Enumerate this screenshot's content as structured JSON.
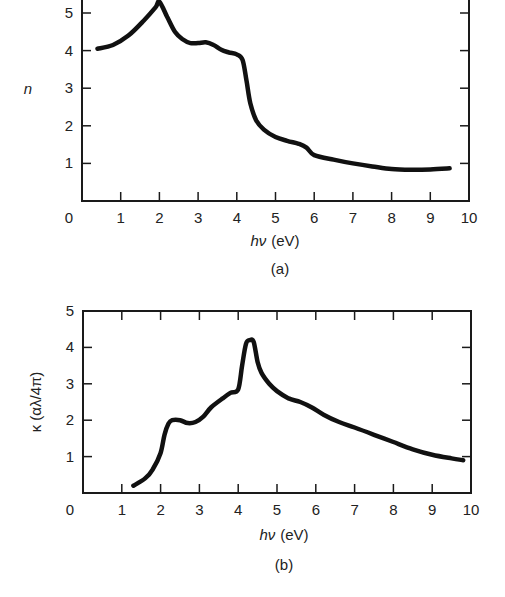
{
  "chart_data": [
    {
      "id": "a",
      "type": "line",
      "title": "",
      "caption": "(a)",
      "xlabel": "hν (eV)",
      "ylabel": "n",
      "xlim": [
        0,
        10
      ],
      "ylim": [
        0,
        5
      ],
      "x_ticks": [
        "0",
        "1",
        "2",
        "3",
        "4",
        "5",
        "6",
        "7",
        "8",
        "9",
        "10"
      ],
      "y_ticks": [
        "1",
        "2",
        "3",
        "4",
        "5"
      ],
      "grid": false,
      "legend": null,
      "series": [
        {
          "name": "n",
          "x": [
            0.4,
            0.8,
            1.2,
            1.6,
            1.9,
            2.0,
            2.2,
            2.4,
            2.6,
            2.8,
            3.0,
            3.2,
            3.4,
            3.6,
            3.8,
            4.0,
            4.15,
            4.25,
            4.35,
            4.5,
            4.7,
            5.0,
            5.3,
            5.6,
            5.8,
            6.0,
            6.5,
            7.0,
            7.5,
            8.0,
            8.5,
            9.0,
            9.5
          ],
          "y": [
            4.05,
            4.15,
            4.4,
            4.8,
            5.15,
            5.3,
            4.9,
            4.5,
            4.3,
            4.2,
            4.2,
            4.22,
            4.15,
            4.02,
            3.95,
            3.9,
            3.75,
            3.2,
            2.6,
            2.15,
            1.9,
            1.7,
            1.6,
            1.52,
            1.42,
            1.22,
            1.1,
            1.0,
            0.92,
            0.85,
            0.83,
            0.84,
            0.87
          ]
        }
      ]
    },
    {
      "id": "b",
      "type": "line",
      "title": "",
      "caption": "(b)",
      "xlabel": "hν (eV)",
      "ylabel": "κ (αλ/4π)",
      "xlim": [
        0,
        10
      ],
      "ylim": [
        0,
        5
      ],
      "x_ticks": [
        "0",
        "1",
        "2",
        "3",
        "4",
        "5",
        "6",
        "7",
        "8",
        "9",
        "10"
      ],
      "y_ticks": [
        "1",
        "2",
        "3",
        "4",
        "5"
      ],
      "grid": false,
      "legend": null,
      "series": [
        {
          "name": "κ",
          "x": [
            1.3,
            1.6,
            1.8,
            2.0,
            2.1,
            2.2,
            2.3,
            2.5,
            2.7,
            2.9,
            3.1,
            3.3,
            3.6,
            3.8,
            4.0,
            4.1,
            4.2,
            4.3,
            4.4,
            4.5,
            4.6,
            4.8,
            5.0,
            5.3,
            5.6,
            5.9,
            6.2,
            6.6,
            7.0,
            7.5,
            8.0,
            8.5,
            9.0,
            9.5,
            9.8
          ],
          "y": [
            0.2,
            0.4,
            0.65,
            1.1,
            1.6,
            1.9,
            2.0,
            2.0,
            1.92,
            1.95,
            2.1,
            2.35,
            2.6,
            2.75,
            2.85,
            3.5,
            4.1,
            4.2,
            4.15,
            3.6,
            3.3,
            3.0,
            2.8,
            2.6,
            2.5,
            2.35,
            2.15,
            1.95,
            1.8,
            1.6,
            1.4,
            1.2,
            1.05,
            0.95,
            0.9
          ]
        }
      ]
    }
  ],
  "labels": {
    "a": {
      "caption": "(a)",
      "xlabel_var": "hν",
      "xlabel_unit": "(eV)",
      "ylabel": "n"
    },
    "b": {
      "caption": "(b)",
      "xlabel_var": "hν",
      "xlabel_unit": "(eV)",
      "ylabel": "κ (αλ/4π)"
    }
  }
}
